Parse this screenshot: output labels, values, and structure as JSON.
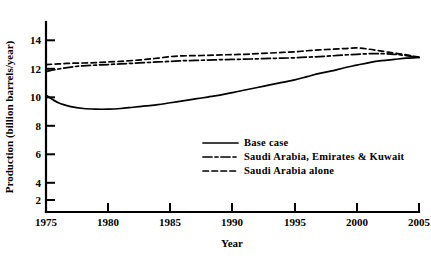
{
  "chart_data": {
    "type": "line",
    "title": "",
    "xlabel": "Year",
    "ylabel": "Production (billion barrels/year)",
    "xlim": [
      1975,
      2005
    ],
    "ylim": [
      0,
      15
    ],
    "xticks": [
      1975,
      1980,
      1985,
      1990,
      1995,
      2000,
      2005
    ],
    "xtick_labels": [
      "1975",
      "1980",
      "1985",
      "1990",
      "1995",
      "2000",
      "2005"
    ],
    "yticks": [
      2,
      4,
      6,
      8,
      10,
      12,
      14
    ],
    "ytick_labels": [
      "2",
      "4",
      "6",
      "8",
      "10",
      "12",
      "14"
    ],
    "grid": false,
    "legend_position": "center-right",
    "series": [
      {
        "name": "Base case",
        "style": "solid",
        "x": [
          1975,
          1976,
          1977,
          1978,
          1979,
          1980,
          1981,
          1982,
          1983,
          1984,
          1985,
          1986,
          1987,
          1988,
          1989,
          1990,
          1991,
          1992,
          1993,
          1994,
          1995,
          1996,
          1997,
          1998,
          1999,
          2000,
          2001,
          2002,
          2003,
          2004,
          2005
        ],
        "values": [
          9.7,
          9.1,
          8.8,
          8.65,
          8.6,
          8.6,
          8.65,
          8.75,
          8.85,
          8.95,
          9.1,
          9.25,
          9.4,
          9.55,
          9.7,
          9.9,
          10.1,
          10.3,
          10.5,
          10.7,
          10.9,
          11.15,
          11.4,
          11.6,
          11.85,
          12.05,
          12.25,
          12.4,
          12.5,
          12.6,
          12.65
        ]
      },
      {
        "name": "Saudi Arabia, Emirates & Kuwait",
        "style": "dash-dot",
        "x": [
          1975,
          1976,
          1977,
          1978,
          1979,
          1980,
          1981,
          1982,
          1983,
          1984,
          1985,
          1986,
          1987,
          1988,
          1989,
          1990,
          1991,
          1992,
          1993,
          1994,
          1995,
          1996,
          1997,
          1998,
          1999,
          2000,
          2001,
          2002,
          2003,
          2004,
          2005
        ],
        "values": [
          11.55,
          11.75,
          11.9,
          12.0,
          12.05,
          12.1,
          12.15,
          12.2,
          12.25,
          12.3,
          12.35,
          12.4,
          12.42,
          12.45,
          12.48,
          12.5,
          12.52,
          12.55,
          12.58,
          12.6,
          12.63,
          12.68,
          12.72,
          12.78,
          12.85,
          12.9,
          12.95,
          12.95,
          12.9,
          12.8,
          12.65
        ]
      },
      {
        "name": "Saudi Arabia alone",
        "style": "dashed",
        "x": [
          1975,
          1976,
          1977,
          1978,
          1979,
          1980,
          1981,
          1982,
          1983,
          1984,
          1985,
          1986,
          1987,
          1988,
          1989,
          1990,
          1991,
          1992,
          1993,
          1994,
          1995,
          1996,
          1997,
          1998,
          1999,
          2000,
          2001,
          2002,
          2003,
          2004,
          2005
        ],
        "values": [
          12.1,
          12.15,
          12.2,
          12.22,
          12.25,
          12.3,
          12.35,
          12.42,
          12.5,
          12.6,
          12.72,
          12.78,
          12.8,
          12.82,
          12.85,
          12.88,
          12.9,
          12.95,
          13.0,
          13.05,
          13.1,
          13.18,
          13.25,
          13.3,
          13.35,
          13.4,
          13.3,
          13.15,
          13.0,
          12.85,
          12.68
        ]
      }
    ]
  },
  "legend": {
    "entries": [
      {
        "label": "Base case",
        "style": "solid"
      },
      {
        "label": "Saudi Arabia, Emirates & Kuwait",
        "style": "dash-dot"
      },
      {
        "label": "Saudi Arabia alone",
        "style": "dashed"
      }
    ]
  },
  "caption": {
    "partial_text": ""
  }
}
